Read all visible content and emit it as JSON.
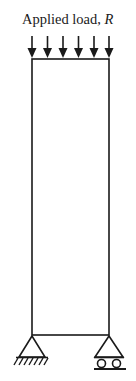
{
  "diagram": {
    "load_label": {
      "text": "Applied load, ",
      "variable": "R"
    },
    "load_arrows": {
      "count": 6,
      "x_positions": [
        32,
        47,
        63,
        78,
        94,
        109
      ],
      "direction": "down"
    },
    "column": {
      "shape": "rectangle",
      "x": 32,
      "y": 59,
      "width": 77,
      "height": 276
    },
    "supports": [
      {
        "type": "pin",
        "side": "left",
        "apex_x": 32
      },
      {
        "type": "roller",
        "side": "right",
        "apex_x": 109
      }
    ],
    "colors": {
      "stroke": "#1a1a1a",
      "background": "#ffffff"
    }
  }
}
